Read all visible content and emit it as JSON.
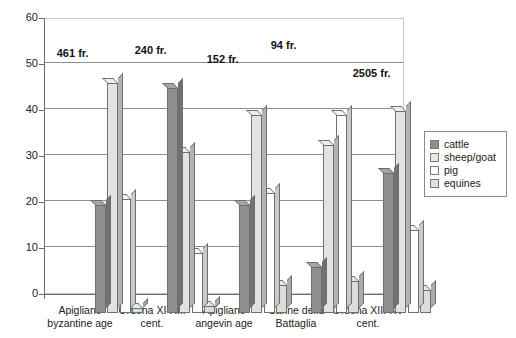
{
  "chart_data": {
    "type": "bar",
    "title": "",
    "subtitle": "",
    "xlabel": "",
    "ylabel": "",
    "ylim": [
      0,
      60
    ],
    "yticks": [
      0,
      10,
      20,
      30,
      40,
      50,
      60
    ],
    "grid": true,
    "grid_values": [
      10,
      20,
      30,
      40,
      50
    ],
    "legend_position": "right",
    "categories": [
      "Apigliano byzantine age",
      "Ordona XI-XIII cent.",
      "Apigliano angevin age",
      "Canne della Battaglia",
      "Ordona XIII-XV cent."
    ],
    "category_lines": [
      [
        "Apigliano",
        "byzantine age"
      ],
      [
        "Ordona XI-XIII",
        "cent."
      ],
      [
        "Apigliano",
        "angevin age"
      ],
      [
        "Canne della",
        "Battaglia"
      ],
      [
        "Ordona XIII-XV",
        "cent."
      ]
    ],
    "series": [
      {
        "name": "cattle",
        "values": [
          23.5,
          49.0,
          23.5,
          10.0,
          30.5
        ]
      },
      {
        "name": "sheep/goat",
        "values": [
          50.0,
          35.0,
          43.0,
          36.5,
          44.0
        ]
      },
      {
        "name": "pig",
        "values": [
          24.8,
          13.0,
          26.0,
          43.0,
          18.0
        ]
      },
      {
        "name": "equines",
        "values": [
          1.0,
          1.5,
          6.0,
          7.0,
          5.0
        ]
      }
    ],
    "annotations": [
      {
        "text": "461 fr.",
        "category": "Apigliano byzantine age"
      },
      {
        "text": "240 fr.",
        "category": "Ordona XI-XIII cent."
      },
      {
        "text": "152 fr.",
        "category": "Apigliano angevin age"
      },
      {
        "text": "94 fr.",
        "category": "Canne della Battaglia"
      },
      {
        "text": "2505 fr.",
        "category": "Ordona XIII-XV cent."
      }
    ]
  },
  "axis": {
    "y_tick_labels": [
      "60",
      "50",
      "40",
      "30",
      "20",
      "10",
      "0"
    ]
  },
  "legend": {
    "entries": [
      {
        "label": "cattle",
        "swatch": "cattle-swatch",
        "color": "#8f8f8f"
      },
      {
        "label": "sheep/goat",
        "swatch": "sheep-goat-swatch",
        "color": "#e8e8e8"
      },
      {
        "label": "pig",
        "swatch": "pig-swatch",
        "color": "#ffffff"
      },
      {
        "label": "equines",
        "swatch": "equines-swatch",
        "color": "#e0e0e0"
      }
    ]
  },
  "caption": {
    "text": ""
  }
}
